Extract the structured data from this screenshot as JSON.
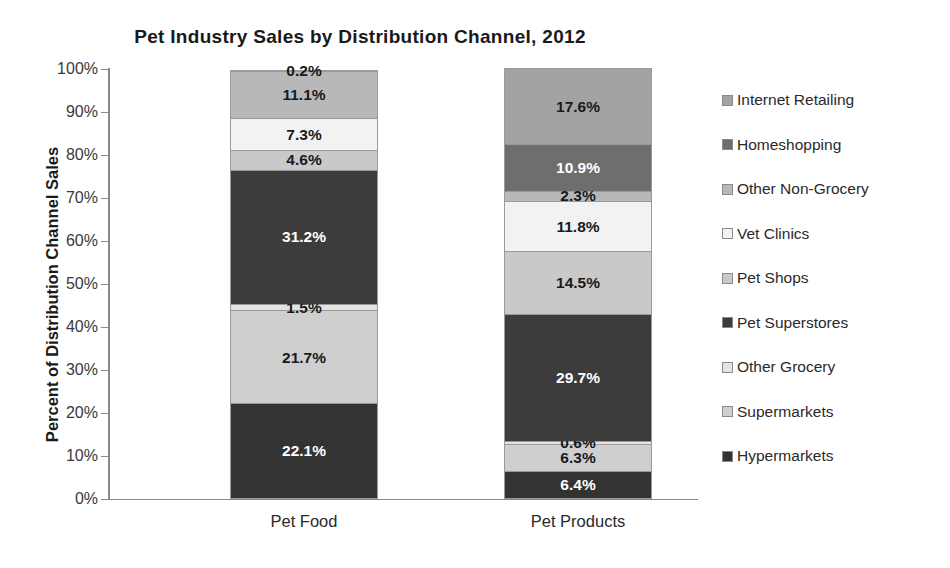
{
  "chart_data": {
    "type": "bar",
    "subtype": "stacked-100-percent",
    "title": "Pet Industry Sales by Distribution Channel, 2012",
    "subtitle": "",
    "xlabel": "",
    "ylabel": "Percent of Distribution Channel Sales",
    "categories": [
      "Pet Food",
      "Pet Products"
    ],
    "ylim": [
      0,
      100
    ],
    "ytick_labels": [
      "100%",
      "90%",
      "80%",
      "70%",
      "60%",
      "50%",
      "40%",
      "30%",
      "20%",
      "10%",
      "0%"
    ],
    "ytick_values": [
      100,
      90,
      80,
      70,
      60,
      50,
      40,
      30,
      20,
      10,
      0
    ],
    "grid": false,
    "legend_position": "right",
    "legend_order_top_to_bottom": [
      "Internet Retailing",
      "Homeshopping",
      "Other Non-Grocery",
      "Vet Clinics",
      "Pet Shops",
      "Pet Superstores",
      "Other Grocery",
      "Supermarkets",
      "Hypermarkets"
    ],
    "series": [
      {
        "name": "Internet Retailing",
        "color": "#a3a3a3",
        "label_color": "dark",
        "values": [
          0.2,
          17.6
        ],
        "value_labels": [
          "0.2%",
          "17.6%"
        ]
      },
      {
        "name": "Homeshopping",
        "color": "#6e6e6e",
        "label_color": "light",
        "values": [
          0.0,
          10.9
        ],
        "value_labels": [
          "",
          "10.9%"
        ]
      },
      {
        "name": "Other Non-Grocery",
        "color": "#b8b8b8",
        "label_color": "dark",
        "values": [
          11.1,
          2.3
        ],
        "value_labels": [
          "11.1%",
          "2.3%"
        ]
      },
      {
        "name": "Vet Clinics",
        "color": "#f2f2f2",
        "label_color": "dark",
        "values": [
          7.3,
          11.8
        ],
        "value_labels": [
          "7.3%",
          "11.8%"
        ]
      },
      {
        "name": "Pet Shops",
        "color": "#c9c9c9",
        "label_color": "dark",
        "values": [
          4.6,
          14.5
        ],
        "value_labels": [
          "4.6%",
          "14.5%"
        ]
      },
      {
        "name": "Pet Superstores",
        "color": "#3c3c3c",
        "label_color": "light",
        "values": [
          31.2,
          29.7
        ],
        "value_labels": [
          "31.2%",
          "29.7%"
        ]
      },
      {
        "name": "Other Grocery",
        "color": "#e3e3e3",
        "label_color": "dark",
        "values": [
          1.5,
          0.6
        ],
        "value_labels": [
          "1.5%",
          "0.6%"
        ]
      },
      {
        "name": "Supermarkets",
        "color": "#cfcfcf",
        "label_color": "dark",
        "values": [
          21.7,
          6.3
        ],
        "value_labels": [
          "21.7%",
          "6.3%"
        ]
      },
      {
        "name": "Hypermarkets",
        "color": "#333333",
        "label_color": "light",
        "values": [
          22.1,
          6.4
        ],
        "value_labels": [
          "22.1%",
          "6.4%"
        ]
      }
    ]
  }
}
